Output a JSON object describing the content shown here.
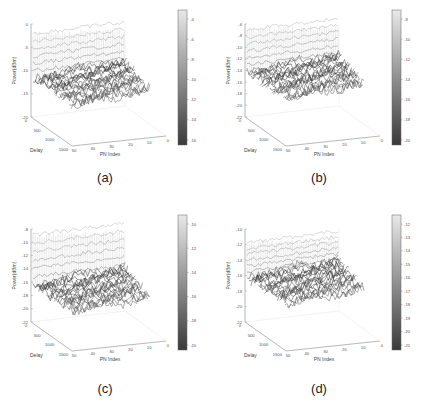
{
  "figure": {
    "panels": [
      {
        "id": "a",
        "caption": "(a)",
        "zlabel": "Power(dBm)",
        "xlabel": "PN Index",
        "ylabel": "Delay",
        "zticks": [
          "0",
          "-5",
          "-10",
          "-15",
          "-20"
        ],
        "colorbar": [
          "-4",
          "-6",
          "-8",
          "-10",
          "-12",
          "-14",
          "-16"
        ],
        "xticks": [
          "50",
          "40",
          "30",
          "20",
          "10",
          "0"
        ],
        "yticks": [
          "0",
          "500",
          "1000",
          "1500"
        ]
      },
      {
        "id": "b",
        "caption": "(b)",
        "zlabel": "Power(dBm)",
        "xlabel": "PN Index",
        "ylabel": "Delay",
        "zticks": [
          "-6",
          "-8",
          "-10",
          "-12",
          "-14",
          "-16",
          "-18",
          "-20",
          "-22"
        ],
        "colorbar": [
          "-8",
          "-10",
          "-12",
          "-14",
          "-16",
          "-18",
          "-20"
        ],
        "xticks": [
          "50",
          "40",
          "30",
          "20",
          "10",
          "0"
        ],
        "yticks": [
          "0",
          "500",
          "1000",
          "1500"
        ]
      },
      {
        "id": "c",
        "caption": "(c)",
        "zlabel": "Power(dBm)",
        "xlabel": "PN Index",
        "ylabel": "Delay",
        "zticks": [
          "-8",
          "-10",
          "-12",
          "-14",
          "-16",
          "-18",
          "-20",
          "-22"
        ],
        "colorbar": [
          "-10",
          "-12",
          "-14",
          "-16",
          "-18",
          "-20"
        ],
        "xticks": [
          "50",
          "40",
          "30",
          "20",
          "10",
          "0"
        ],
        "yticks": [
          "0",
          "500",
          "1000",
          "1500"
        ]
      },
      {
        "id": "d",
        "caption": "(d)",
        "zlabel": "Power(dBm)",
        "xlabel": "PN Index",
        "ylabel": "Delay",
        "zticks": [
          "-10",
          "-12",
          "-14",
          "-16",
          "-18",
          "-20",
          "-22"
        ],
        "colorbar": [
          "-12",
          "-13",
          "-14",
          "-15",
          "-16",
          "-17",
          "-18",
          "-19",
          "-20",
          "-21"
        ],
        "xticks": [
          "50",
          "40",
          "30",
          "20",
          "10",
          "0"
        ],
        "yticks": [
          "0",
          "500",
          "1000",
          "1500"
        ]
      }
    ]
  },
  "chart_data": [
    {
      "type": "surface",
      "title": "(a)",
      "xlabel": "PN Index",
      "ylabel": "Delay",
      "zlabel": "Power(dBm)",
      "x_range": [
        0,
        50
      ],
      "y_range": [
        0,
        1500
      ],
      "zlim": [
        -20,
        0
      ],
      "zticks": [
        0,
        -5,
        -10,
        -15,
        -20
      ],
      "colorbar": {
        "ticks": [
          -4,
          -6,
          -8,
          -10,
          -12,
          -14,
          -16
        ],
        "colormap": "gray"
      },
      "description": "Mesh surface: peak ridge near Delay 0 up to about -3 dBm, noise floor around -15 to -17 dBm"
    },
    {
      "type": "surface",
      "title": "(b)",
      "xlabel": "PN Index",
      "ylabel": "Delay",
      "zlabel": "Power(dBm)",
      "x_range": [
        0,
        50
      ],
      "y_range": [
        0,
        1500
      ],
      "zlim": [
        -22,
        -6
      ],
      "zticks": [
        -6,
        -8,
        -10,
        -12,
        -14,
        -16,
        -18,
        -20,
        -22
      ],
      "colorbar": {
        "ticks": [
          -8,
          -10,
          -12,
          -14,
          -16,
          -18,
          -20
        ],
        "colormap": "gray"
      },
      "description": "Mesh surface: peak about -7 dBm, noise floor around -18 to -20 dBm"
    },
    {
      "type": "surface",
      "title": "(c)",
      "xlabel": "PN Index",
      "ylabel": "Delay",
      "zlabel": "Power(dBm)",
      "x_range": [
        0,
        50
      ],
      "y_range": [
        0,
        1500
      ],
      "zlim": [
        -22,
        -8
      ],
      "zticks": [
        -8,
        -10,
        -12,
        -14,
        -16,
        -18,
        -20,
        -22
      ],
      "colorbar": {
        "ticks": [
          -10,
          -12,
          -14,
          -16,
          -18,
          -20
        ],
        "colormap": "gray"
      },
      "description": "Mesh surface: peak about -9 dBm, noise floor around -19 to -21 dBm"
    },
    {
      "type": "surface",
      "title": "(d)",
      "xlabel": "PN Index",
      "ylabel": "Delay",
      "zlabel": "Power(dBm)",
      "x_range": [
        0,
        50
      ],
      "y_range": [
        0,
        1500
      ],
      "zlim": [
        -22,
        -10
      ],
      "zticks": [
        -10,
        -12,
        -14,
        -16,
        -18,
        -20,
        -22
      ],
      "colorbar": {
        "ticks": [
          -12,
          -13,
          -14,
          -15,
          -16,
          -17,
          -18,
          -19,
          -20,
          -21
        ],
        "colormap": "gray"
      },
      "description": "Mesh surface: peak about -11 dBm, noise floor around -19 to -21 dBm"
    }
  ]
}
